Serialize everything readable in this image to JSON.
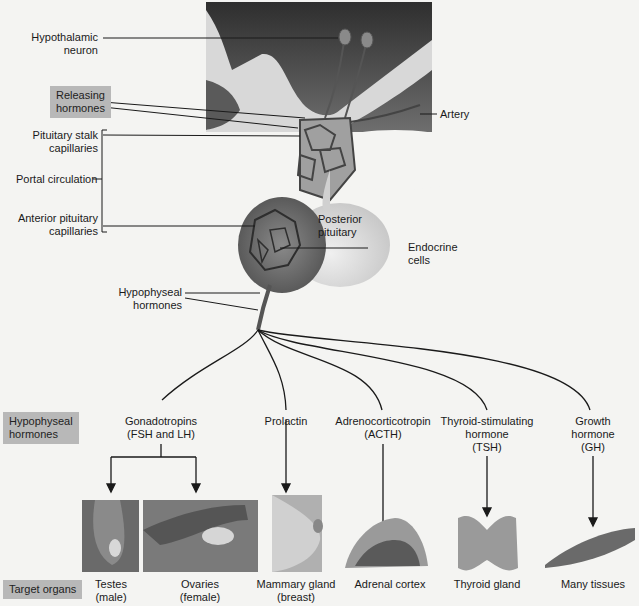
{
  "diagram": {
    "labels": {
      "hypothalamic_neuron": [
        "Hypothalamic",
        "neuron"
      ],
      "releasing_hormones": [
        "Releasing",
        "hormones"
      ],
      "artery": "Artery",
      "portal_circulation": "Portal circulation",
      "pituitary_stalk_capillaries": [
        "Pituitary stalk",
        "capillaries"
      ],
      "anterior_pituitary_capillaries": [
        "Anterior pituitary",
        "capillaries"
      ],
      "posterior_pituitary": [
        "Posterior",
        "pituitary"
      ],
      "endocrine_cells": [
        "Endocrine",
        "cells"
      ],
      "hypophyseal_hormones_stalk": [
        "Hypophyseal",
        "hormones"
      ]
    },
    "row_headers": {
      "hormones": [
        "Hypophyseal",
        "hormones"
      ],
      "targets": "Target organs"
    },
    "hormones": [
      {
        "lines": [
          "Gonadotropins",
          "(FSH and LH)"
        ]
      },
      {
        "lines": [
          "Prolactin"
        ]
      },
      {
        "lines": [
          "Adrenocorticotropin",
          "(ACTH)"
        ]
      },
      {
        "lines": [
          "Thyroid-stimulating",
          "hormone",
          "(TSH)"
        ]
      },
      {
        "lines": [
          "Growth",
          "hormone",
          "(GH)"
        ]
      }
    ],
    "targets": [
      {
        "lines": [
          "Testes",
          "(male)"
        ]
      },
      {
        "lines": [
          "Ovaries",
          "(female)"
        ]
      },
      {
        "lines": [
          "Mammary gland",
          "(breast)"
        ]
      },
      {
        "lines": [
          "Adrenal cortex"
        ]
      },
      {
        "lines": [
          "Thyroid gland"
        ]
      },
      {
        "lines": [
          "Many tissues"
        ]
      }
    ],
    "colors": {
      "background": "#f4f4f2",
      "label_box": "#b8b8b8",
      "brain_dark": "#3a3a3a",
      "brain_light": "#d6d6d6",
      "gland": "#6a6a6a",
      "posterior": "#dcdcdc"
    }
  }
}
